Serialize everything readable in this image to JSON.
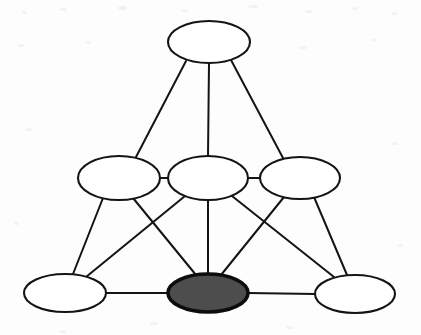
{
  "diagram": {
    "type": "node-link-diagram",
    "canvas": {
      "width": 421,
      "height": 335
    },
    "background_color": "#fdfdfd",
    "style": {
      "node_fill_default": "#ffffff",
      "node_fill_highlight": "#4d4d4d",
      "node_stroke": "#141414",
      "node_stroke_width_default": 2.1,
      "node_stroke_width_highlight": 3.6,
      "edge_stroke": "#141414",
      "edge_stroke_width": 2.0
    },
    "layers": [
      {
        "name": "apex",
        "node_ids": [
          "n1"
        ]
      },
      {
        "name": "middle",
        "node_ids": [
          "n2",
          "n3",
          "n4"
        ]
      },
      {
        "name": "base",
        "node_ids": [
          "n5",
          "n6",
          "n7"
        ]
      }
    ],
    "nodes": [
      {
        "id": "n1",
        "name": "node-top",
        "label": "",
        "cx": 209,
        "cy": 42,
        "rx": 41,
        "ry": 21,
        "fill": "#ffffff",
        "highlighted": false,
        "layer": "apex"
      },
      {
        "id": "n2",
        "name": "node-mid-left",
        "label": "",
        "cx": 119,
        "cy": 178,
        "rx": 41,
        "ry": 22,
        "fill": "#ffffff",
        "highlighted": false,
        "layer": "middle"
      },
      {
        "id": "n3",
        "name": "node-mid-center",
        "label": "",
        "cx": 208,
        "cy": 178,
        "rx": 40,
        "ry": 22,
        "fill": "#ffffff",
        "highlighted": false,
        "layer": "middle"
      },
      {
        "id": "n4",
        "name": "node-mid-right",
        "label": "",
        "cx": 300,
        "cy": 178,
        "rx": 40,
        "ry": 21,
        "fill": "#ffffff",
        "highlighted": false,
        "layer": "middle"
      },
      {
        "id": "n5",
        "name": "node-bottom-left",
        "label": "",
        "cx": 65,
        "cy": 293,
        "rx": 41,
        "ry": 19,
        "fill": "#ffffff",
        "highlighted": false,
        "layer": "base"
      },
      {
        "id": "n6",
        "name": "node-bottom-center",
        "label": "",
        "cx": 208,
        "cy": 293,
        "rx": 40,
        "ry": 19,
        "fill": "#4d4d4d",
        "highlighted": true,
        "layer": "base"
      },
      {
        "id": "n7",
        "name": "node-bottom-right",
        "label": "",
        "cx": 355,
        "cy": 294,
        "rx": 40,
        "ry": 19,
        "fill": "#ffffff",
        "highlighted": false,
        "layer": "base"
      }
    ],
    "edges": [
      {
        "id": "e1",
        "source": "n1",
        "target": "n2",
        "x1": 186,
        "y1": 61,
        "x2": 136,
        "y2": 157
      },
      {
        "id": "e2",
        "source": "n1",
        "target": "n3",
        "x1": 209,
        "y1": 63,
        "x2": 208,
        "y2": 156
      },
      {
        "id": "e3",
        "source": "n1",
        "target": "n4",
        "x1": 231,
        "y1": 60,
        "x2": 283,
        "y2": 158
      },
      {
        "id": "e4",
        "source": "n2",
        "target": "n3",
        "x1": 160,
        "y1": 178,
        "x2": 168,
        "y2": 178
      },
      {
        "id": "e5",
        "source": "n3",
        "target": "n4",
        "x1": 248,
        "y1": 178,
        "x2": 260,
        "y2": 178
      },
      {
        "id": "e6",
        "source": "n2",
        "target": "n5",
        "x1": 103,
        "y1": 198,
        "x2": 73,
        "y2": 274
      },
      {
        "id": "e7",
        "source": "n2",
        "target": "n6",
        "x1": 133,
        "y1": 198,
        "x2": 196,
        "y2": 275
      },
      {
        "id": "e8",
        "source": "n3",
        "target": "n5",
        "x1": 185,
        "y1": 196,
        "x2": 86,
        "y2": 277
      },
      {
        "id": "e9",
        "source": "n3",
        "target": "n6",
        "x1": 208,
        "y1": 200,
        "x2": 208,
        "y2": 274
      },
      {
        "id": "e10",
        "source": "n3",
        "target": "n7",
        "x1": 232,
        "y1": 196,
        "x2": 334,
        "y2": 277
      },
      {
        "id": "e11",
        "source": "n4",
        "target": "n6",
        "x1": 284,
        "y1": 197,
        "x2": 221,
        "y2": 275
      },
      {
        "id": "e12",
        "source": "n4",
        "target": "n7",
        "x1": 314,
        "y1": 197,
        "x2": 347,
        "y2": 275
      },
      {
        "id": "e13",
        "source": "n5",
        "target": "n6",
        "x1": 106,
        "y1": 293,
        "x2": 168,
        "y2": 293
      },
      {
        "id": "e14",
        "source": "n6",
        "target": "n7",
        "x1": 248,
        "y1": 293,
        "x2": 315,
        "y2": 294
      }
    ],
    "specks": [
      {
        "x": 22,
        "y": 11,
        "w": 5,
        "h": 3
      },
      {
        "x": 60,
        "y": 8,
        "w": 7,
        "h": 3
      },
      {
        "x": 118,
        "y": 6,
        "w": 9,
        "h": 4
      },
      {
        "x": 182,
        "y": 9,
        "w": 6,
        "h": 3
      },
      {
        "x": 248,
        "y": 5,
        "w": 11,
        "h": 3
      },
      {
        "x": 305,
        "y": 10,
        "w": 8,
        "h": 3
      },
      {
        "x": 352,
        "y": 7,
        "w": 6,
        "h": 3
      },
      {
        "x": 392,
        "y": 12,
        "w": 5,
        "h": 3
      },
      {
        "x": 18,
        "y": 44,
        "w": 6,
        "h": 3
      },
      {
        "x": 86,
        "y": 41,
        "w": 5,
        "h": 3
      },
      {
        "x": 300,
        "y": 46,
        "w": 7,
        "h": 3
      },
      {
        "x": 372,
        "y": 38,
        "w": 5,
        "h": 3
      },
      {
        "x": 26,
        "y": 128,
        "w": 6,
        "h": 3
      },
      {
        "x": 392,
        "y": 142,
        "w": 6,
        "h": 3
      },
      {
        "x": 14,
        "y": 222,
        "w": 5,
        "h": 3
      },
      {
        "x": 398,
        "y": 244,
        "w": 5,
        "h": 3
      },
      {
        "x": 150,
        "y": 322,
        "w": 8,
        "h": 3
      },
      {
        "x": 286,
        "y": 326,
        "w": 7,
        "h": 3
      },
      {
        "x": 60,
        "y": 330,
        "w": 6,
        "h": 3
      }
    ]
  }
}
